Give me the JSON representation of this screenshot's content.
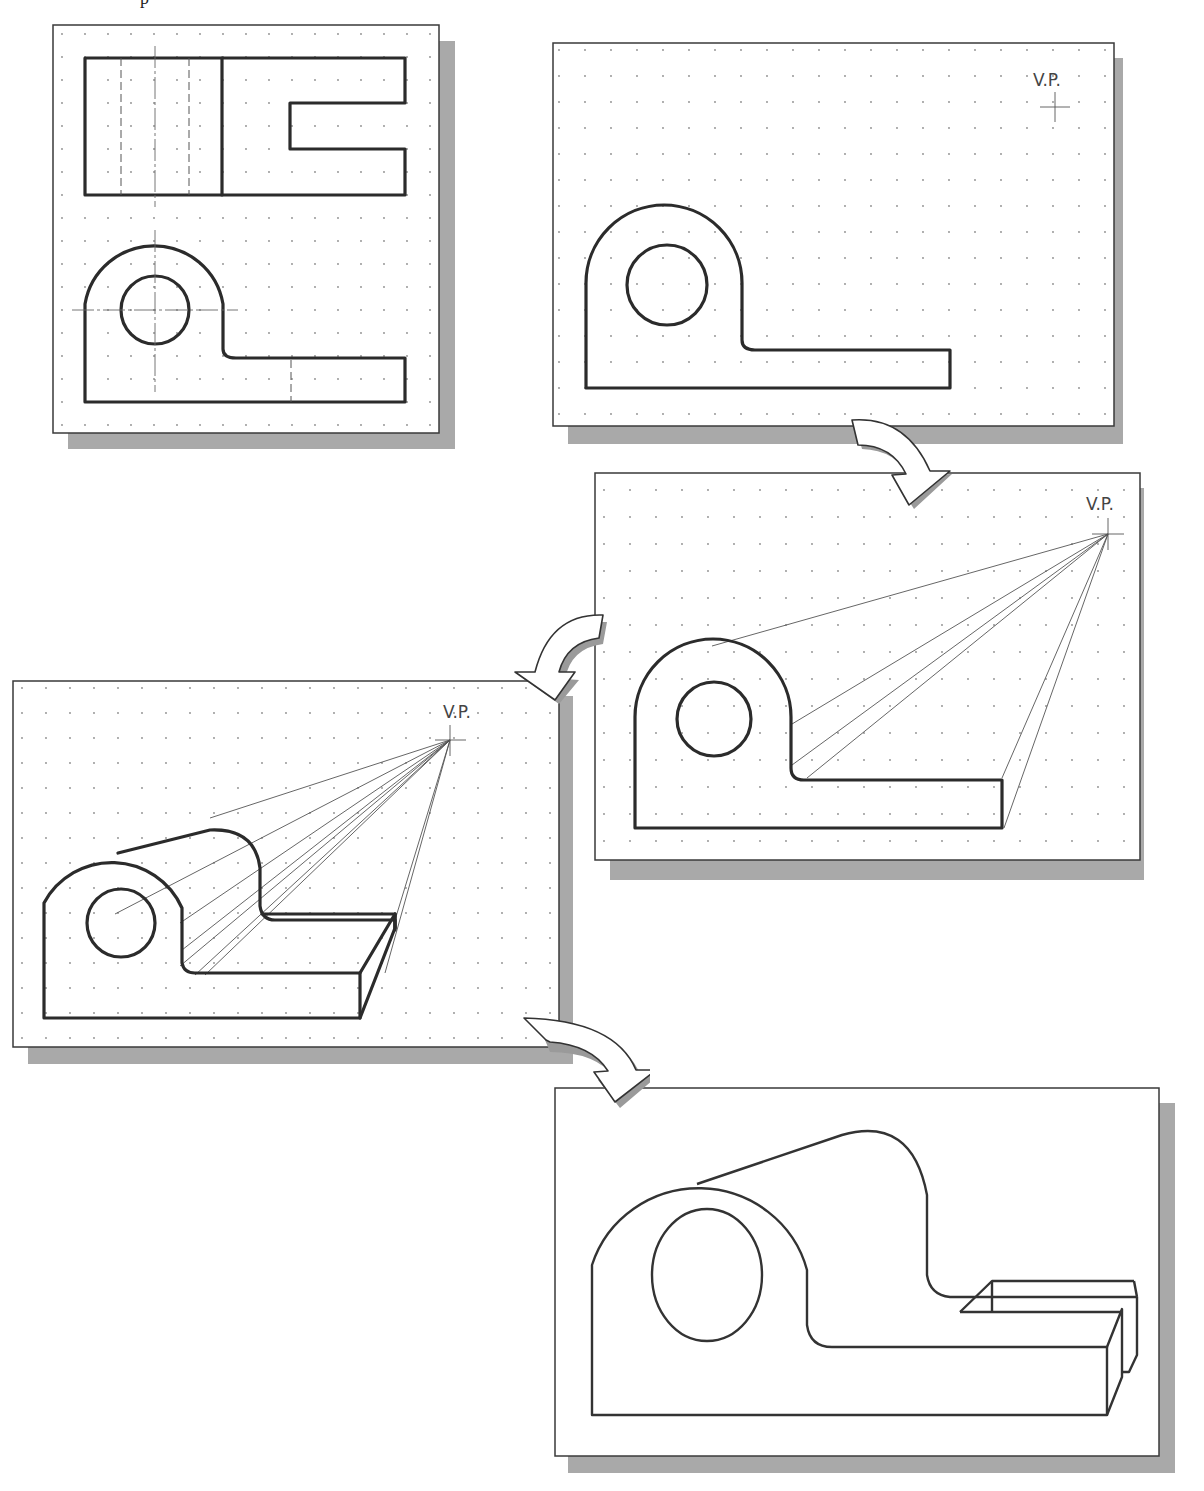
{
  "page": {
    "clipped_caption_fragment": "p"
  },
  "panels": [
    {
      "id": "step-1",
      "description": "Two orthographic views (top and front)",
      "grid": "dotted",
      "vp_label": null
    },
    {
      "id": "step-2",
      "description": "Front view with vanishing point",
      "grid": "dotted",
      "vp_label": "V.P."
    },
    {
      "id": "step-3",
      "description": "Projection lines to vanishing point",
      "grid": "dotted",
      "vp_label": "V.P."
    },
    {
      "id": "step-4",
      "description": "Depth established, back edges drawn",
      "grid": "dotted",
      "vp_label": "V.P."
    },
    {
      "id": "step-5",
      "description": "Final one-point perspective view",
      "grid": "none",
      "vp_label": null
    }
  ],
  "arrows": [
    {
      "from": "step-2",
      "to": "step-3",
      "direction": "curved-down-right"
    },
    {
      "from": "step-3",
      "to": "step-4",
      "direction": "curved-down-left"
    },
    {
      "from": "step-4",
      "to": "step-5",
      "direction": "curved-down-right"
    }
  ],
  "labels": {
    "vp_step2": "V.P.",
    "vp_step3": "V.P.",
    "vp_step4": "V.P."
  },
  "colors": {
    "line": "#2b2b2b",
    "shadow": "#a9a9a9",
    "grid_dot": "#8a8a8a",
    "background": "#ffffff"
  }
}
